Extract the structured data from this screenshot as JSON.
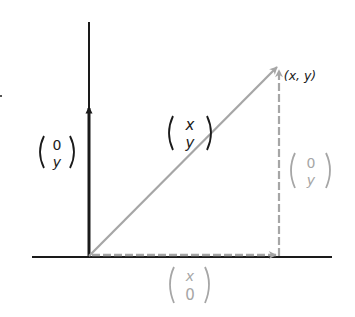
{
  "diagram": {
    "colors": {
      "dark": "#1a1a1a",
      "gray": "#a6a6a6",
      "background": "#ffffff"
    },
    "point_label": "(x, y)",
    "vectors": {
      "vertical": {
        "top": "0",
        "bottom": "y"
      },
      "diagonal": {
        "top": "x",
        "bottom": "y"
      },
      "right_vertical": {
        "top": "0",
        "bottom": "y"
      },
      "horizontal": {
        "top": "x",
        "bottom": "0"
      }
    }
  }
}
